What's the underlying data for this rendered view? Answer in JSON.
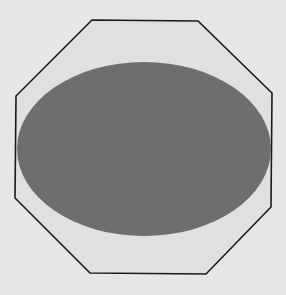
{
  "figure": {
    "title": "",
    "width": 286,
    "height": 295
  },
  "colors": {
    "background": "#e6e6e6",
    "octagon_fill": "#e0e0e0",
    "octagon_stroke": "#1a1a1a",
    "ellipse_fill": "#6e6e6e"
  },
  "octagon": {
    "points": "92,20 198,21 272,93 271,207 206,274 90,273 15,198 16,96",
    "stroke_width": 1.6
  },
  "ellipse": {
    "cx": 144,
    "cy": 149,
    "rx": 127,
    "ry": 87
  }
}
